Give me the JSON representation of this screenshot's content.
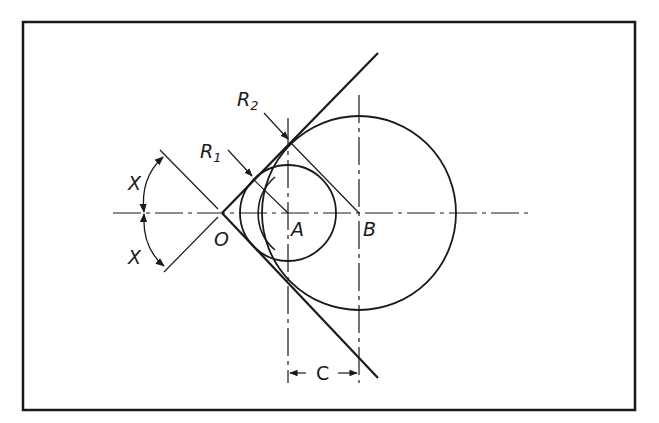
{
  "diagram": {
    "type": "geometric construction",
    "labels": {
      "angle_top": "X",
      "angle_bottom": "X",
      "vertex": "O",
      "center_a": "A",
      "center_b": "B",
      "radius_1": "R",
      "radius_1_sub": "1",
      "radius_2": "R",
      "radius_2_sub": "2",
      "dimension_c": "C"
    },
    "colors": {
      "line": "#1a1a1a",
      "background": "#ffffff",
      "frame": "#1a1a1a"
    }
  }
}
